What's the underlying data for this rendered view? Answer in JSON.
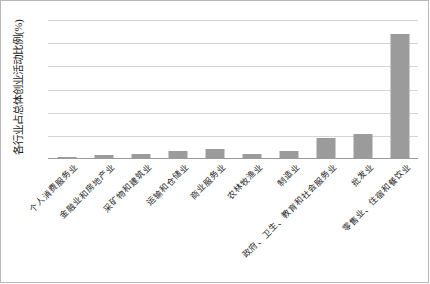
{
  "chart_data": {
    "type": "bar",
    "title": "",
    "subtitle": "",
    "xlabel": "",
    "ylabel": "各行业占总体创业活动比例(%)",
    "ylim": [
      0,
      60
    ],
    "yticks": [
      0,
      10,
      20,
      30,
      40,
      50,
      60
    ],
    "ytick_labels": [
      "0",
      "10",
      "20",
      "30",
      "40",
      "50",
      "60"
    ],
    "grid": true,
    "legend": false,
    "legend_position": "none",
    "bar_color": "#9b9b9b",
    "categories": [
      "个人消费服务业",
      "金融业和房地产业",
      "采矿物和建筑业",
      "运输和仓储业",
      "商业服务业",
      "农林牧渔业",
      "制造业",
      "政府、卫生、教育和社会服务业",
      "批发业",
      "零售业、住宿和餐饮业"
    ],
    "values": [
      1,
      1.7,
      2.2,
      3.3,
      4.5,
      2.2,
      3.6,
      9,
      11,
      54
    ]
  },
  "colors": {
    "bar": "#9b9b9b",
    "grid": "#d4d4d4",
    "axis": "#9a9a9a",
    "frame": "#b8b8b8",
    "text": "#1f1f1f"
  }
}
